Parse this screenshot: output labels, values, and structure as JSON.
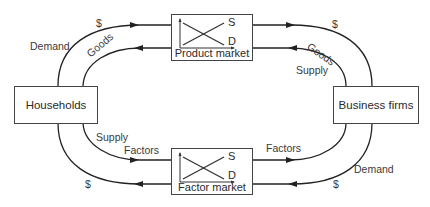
{
  "diagram": {
    "nodes": {
      "households": {
        "label": "Households"
      },
      "business_firms": {
        "label": "Business firms"
      },
      "product_market": {
        "label": "Product market",
        "supply_curve_label": "S",
        "demand_curve_label": "D"
      },
      "factor_market": {
        "label": "Factor market",
        "supply_curve_label": "S",
        "demand_curve_label": "D"
      }
    },
    "flows": {
      "top_left_outer": {
        "label": "$",
        "role_label": "Demand",
        "direction": "households-to-product-market"
      },
      "top_left_inner": {
        "label": "Goods",
        "direction": "product-market-to-households"
      },
      "top_right_outer": {
        "label": "$",
        "direction": "product-market-to-business-firms"
      },
      "top_right_inner": {
        "label": "Goods",
        "role_label": "Supply",
        "direction": "business-firms-to-product-market"
      },
      "bottom_left_inner": {
        "label": "Factors",
        "role_label": "Supply",
        "direction": "households-to-factor-market"
      },
      "bottom_left_outer": {
        "label": "$",
        "direction": "factor-market-to-households"
      },
      "bottom_right_inner": {
        "label": "Factors",
        "direction": "factor-market-to-business-firms"
      },
      "bottom_right_outer": {
        "label": "$",
        "role_label": "Demand",
        "direction": "business-firms-to-factor-market"
      }
    },
    "colors": {
      "line": "#222222",
      "text": "#2a2a2a",
      "background": "#ffffff"
    }
  }
}
